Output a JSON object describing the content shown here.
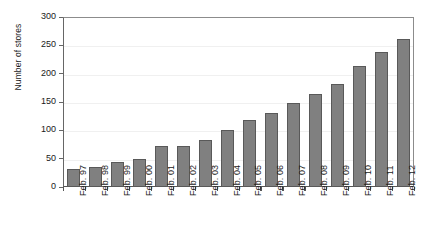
{
  "chart_data": {
    "type": "bar",
    "title": "",
    "xlabel": "",
    "ylabel": "Number of stores",
    "ylim": [
      0,
      300
    ],
    "yticks": [
      0,
      50,
      100,
      150,
      200,
      250,
      300
    ],
    "ytick_labels": [
      "0",
      "50",
      "100",
      "150",
      "200",
      "250",
      "300"
    ],
    "grid": true,
    "legend": "none",
    "bar_color": "#808080",
    "bar_edge_color": "#595959",
    "categories": [
      "Feb. 97",
      "Feb. 98",
      "Feb. 99",
      "Feb. 00",
      "Feb. 01",
      "Feb. 02",
      "Feb. 03",
      "Feb. 04",
      "Feb. 05",
      "Feb. 06",
      "Feb. 07",
      "Feb. 08",
      "Feb. 09",
      "Feb. 10",
      "Feb. 11",
      "Feb. 12"
    ],
    "values": [
      32,
      36,
      44,
      49,
      72,
      72,
      83,
      100,
      118,
      131,
      148,
      165,
      182,
      213,
      238,
      261
    ]
  }
}
